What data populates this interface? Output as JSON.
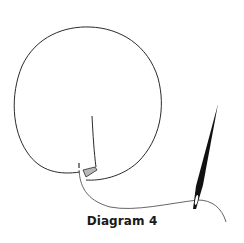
{
  "diagram": {
    "caption": "Diagram 4",
    "colors": {
      "stroke": "#2a2a2a",
      "thread": "#555555",
      "knot_fill": "#b8b8b8",
      "needle": "#111111"
    },
    "elements": [
      {
        "name": "thread-loop",
        "description": "large circular loop of thread"
      },
      {
        "name": "thread-tail",
        "description": "short vertical thread tail inside the loop"
      },
      {
        "name": "knot-wrap",
        "description": "shaded wrap where thread crosses"
      },
      {
        "name": "working-thread",
        "description": "thread running to the needle eye"
      },
      {
        "name": "needle",
        "description": "sewing needle pointing up-right"
      }
    ]
  }
}
